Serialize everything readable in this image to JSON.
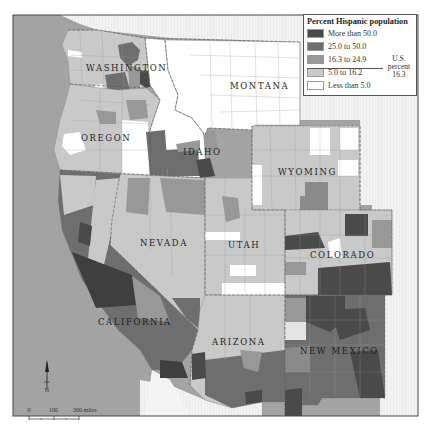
{
  "legend": {
    "title": "Percent Hispanic population",
    "items": [
      {
        "label": "More than 50.0",
        "color": "#4a4a4a"
      },
      {
        "label": "25.0 to 50.0",
        "color": "#6e6e6e"
      },
      {
        "label": "16.3 to 24.9",
        "color": "#989898"
      },
      {
        "label": "5.0 to 16.2",
        "color": "#c9c9c9"
      },
      {
        "label": "Less than 5.0",
        "color": "#ffffff"
      }
    ],
    "us_note": {
      "line1": "U.S.",
      "line2": "percent",
      "line3": "16.3"
    }
  },
  "states": [
    {
      "name": "WASHINGTON"
    },
    {
      "name": "MONTANA"
    },
    {
      "name": "OREGON"
    },
    {
      "name": "IDAHO"
    },
    {
      "name": "WYOMING"
    },
    {
      "name": "NEVADA"
    },
    {
      "name": "UTAH"
    },
    {
      "name": "COLORADO"
    },
    {
      "name": "CALIFORNIA"
    },
    {
      "name": "ARIZONA"
    },
    {
      "name": "NEW MEXICO"
    }
  ],
  "north_arrow": {
    "label": "N"
  },
  "scale_bar": {
    "tick0": "0",
    "tick1": "100",
    "tick2": "200 miles"
  },
  "colors": {
    "ocean": "#9e9e9e",
    "canada_mexico": "#f0f0f0",
    "other_us": "#f4f4f4",
    "frame": "#444444"
  }
}
